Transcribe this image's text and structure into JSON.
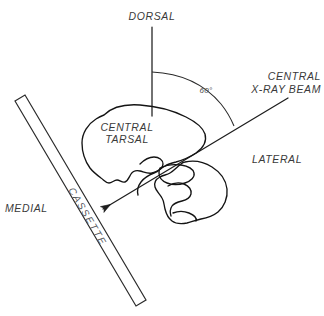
{
  "diagram": {
    "background_color": "#ffffff",
    "line_color": "#1d1d1d",
    "text_color": "#3a3a3a",
    "labels": {
      "dorsal": "DORSAL",
      "medial": "MEDIAL",
      "lateral": "LATERAL",
      "cassette": "CASSETTE",
      "central_tarsal_line1": "CENTRAL",
      "central_tarsal_line2": "TARSAL",
      "beam_line1": "CENTRAL",
      "beam_line2": "X-RAY BEAM",
      "angle": "60°"
    }
  }
}
